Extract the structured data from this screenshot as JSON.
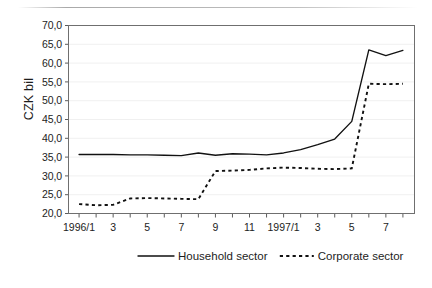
{
  "chart_data": {
    "type": "line",
    "title": "",
    "xlabel": "",
    "ylabel": "CZK bil",
    "ylim": [
      20.0,
      70.0
    ],
    "yticks": [
      "20,0",
      "25,0",
      "30,0",
      "35,0",
      "40,0",
      "45,0",
      "50,0",
      "55,0",
      "60,0",
      "65,0",
      "70,0"
    ],
    "ytick_values": [
      20,
      25,
      30,
      35,
      40,
      45,
      50,
      55,
      60,
      65,
      70
    ],
    "grid": true,
    "legend_position": "bottom",
    "x": [
      "1996/1",
      "1996/2",
      "1996/3",
      "1996/4",
      "1996/5",
      "1996/6",
      "1996/7",
      "1996/8",
      "1996/9",
      "1996/10",
      "1996/11",
      "1996/12",
      "1997/1",
      "1997/2",
      "1997/3",
      "1997/4",
      "1997/5",
      "1997/6",
      "1997/7",
      "1997/8"
    ],
    "xtick_labels": [
      "1996/1",
      "",
      "3",
      "",
      "5",
      "",
      "7",
      "",
      "9",
      "",
      "11",
      "",
      "1997/1",
      "",
      "3",
      "",
      "5",
      "",
      "7",
      ""
    ],
    "series": [
      {
        "name": "Household sector",
        "style": "solid",
        "values": [
          35.7,
          35.7,
          35.7,
          35.6,
          35.6,
          35.5,
          35.4,
          36.1,
          35.5,
          35.9,
          35.8,
          35.6,
          36.1,
          37.0,
          38.3,
          39.8,
          44.5,
          63.5,
          62.0,
          63.4
        ]
      },
      {
        "name": "Corporate sector",
        "style": "dashed",
        "values": [
          22.5,
          22.2,
          22.3,
          24.0,
          24.1,
          24.0,
          23.9,
          23.8,
          31.3,
          31.4,
          31.6,
          32.0,
          32.2,
          32.1,
          31.9,
          31.8,
          32.0,
          54.5,
          54.4,
          54.5
        ]
      }
    ]
  },
  "legend": {
    "items": [
      {
        "label": "Household sector",
        "style": "solid"
      },
      {
        "label": "Corporate sector",
        "style": "dashed"
      }
    ]
  }
}
